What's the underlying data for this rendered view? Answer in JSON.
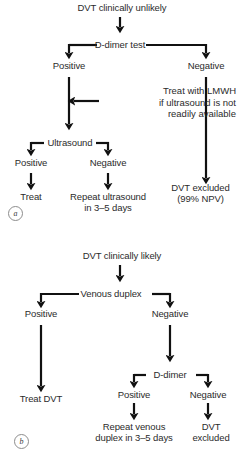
{
  "figure": {
    "line_color": "#111111",
    "text_color": "#2b2b2b",
    "background": "#ffffff"
  },
  "panels": [
    {
      "id": "a",
      "label": "a",
      "root": "DVT clinically unlikely",
      "nodes": {
        "root": "DVT clinically unlikely",
        "test": "D-dimer test",
        "left_branch": "Positive",
        "right_branch": "Negative",
        "ultrasound": "Ultrasound",
        "us_positive": "Positive",
        "us_negative": "Negative",
        "treat": "Treat",
        "repeat_line1": "Repeat ultrasound",
        "repeat_line2": "in 3–5 days",
        "excluded_line1": "DVT excluded",
        "excluded_line2": "(99% NPV)"
      },
      "annotation": {
        "line1": "Treat with LMWH",
        "line2": "if ultrasound is not",
        "line3": "readily available"
      }
    },
    {
      "id": "b",
      "label": "b",
      "root": "DVT clinically likely",
      "nodes": {
        "root": "DVT clinically likely",
        "test": "Venous duplex",
        "left_branch": "Positive",
        "right_branch": "Negative",
        "treat_dvt": "Treat DVT",
        "ddimer": "D-dimer",
        "dd_positive": "Positive",
        "dd_negative": "Negative",
        "repeat_line1": "Repeat venous",
        "repeat_line2": "duplex in 3–5 days",
        "excluded_line1": "DVT",
        "excluded_line2": "excluded"
      }
    }
  ]
}
